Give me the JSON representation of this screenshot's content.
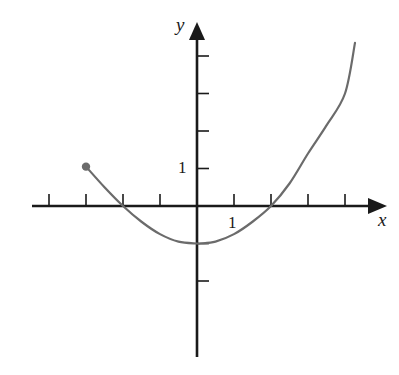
{
  "chart_data": {
    "type": "line",
    "title": "",
    "xlabel": "x",
    "ylabel": "y",
    "x_tick_label": "1",
    "y_tick_label": "1",
    "xlim": [
      -4.5,
      5.2
    ],
    "ylim": [
      -4,
      5
    ],
    "x_ticks": [
      -4,
      -3,
      -2,
      -1,
      1,
      2,
      3,
      4
    ],
    "y_ticks": [
      -2,
      -1,
      1,
      2,
      3,
      4
    ],
    "grid": false,
    "legend": null,
    "series": [
      {
        "name": "f(x)",
        "color": "#6b6b6b",
        "closed_endpoint": {
          "x": -3,
          "y": 1
        },
        "x": [
          -3,
          -2.5,
          -2,
          -1.5,
          -1,
          -0.5,
          0,
          0.1,
          0.5,
          1,
          1.5,
          2,
          2.5,
          3,
          3.5,
          4,
          4.27
        ],
        "y": [
          1.05,
          0.5,
          0,
          -0.42,
          -0.75,
          -0.95,
          -1.0,
          -1.0,
          -0.95,
          -0.75,
          -0.42,
          0,
          0.6,
          1.4,
          2.15,
          3.0,
          4.35
        ]
      }
    ],
    "annotations": []
  },
  "layout": {
    "origin_px": [
      197,
      206
    ],
    "unit_x_px": 37,
    "unit_y_px": 37.5,
    "x_axis_px": [
      32,
      387
    ],
    "y_axis_px": [
      357,
      22
    ]
  }
}
